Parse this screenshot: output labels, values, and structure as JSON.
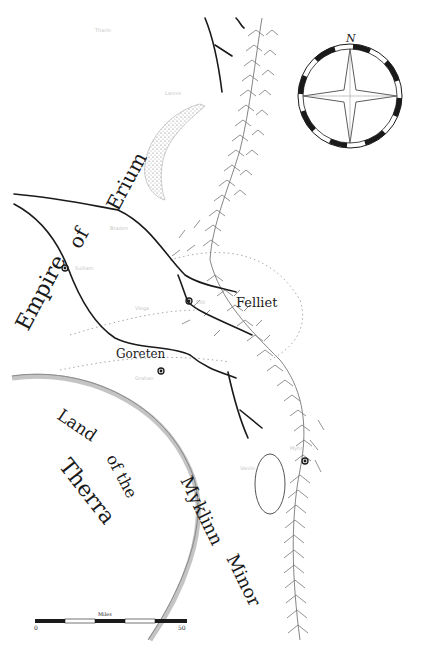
{
  "map": {
    "regions": {
      "empire_line1": "Empire",
      "empire_line2": "of",
      "empire_line3": "Erium",
      "felliet": "Felliet",
      "goreten": "Goreten",
      "therra_line1": "Land",
      "therra_line2": "of the",
      "therra_line3": "Therra",
      "myklinn_line1": "Myklinn",
      "myklinn_line2": "Minor"
    },
    "compass": {
      "north_label": "N"
    },
    "scale_bar": {
      "title": "Miles",
      "start": "0",
      "end": "50"
    },
    "colors": {
      "ink": "#1a1a1a",
      "pencil": "#9a9a9a",
      "paper": "#ffffff"
    }
  }
}
